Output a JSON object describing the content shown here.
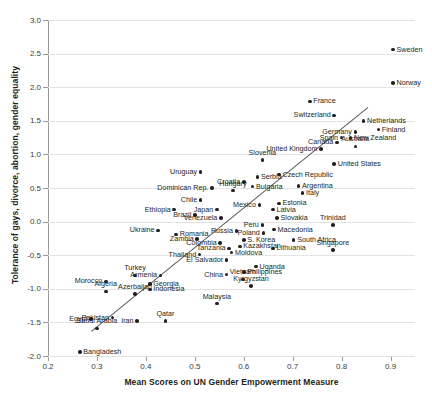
{
  "chart_data": {
    "type": "scatter",
    "title": "",
    "xlabel": "Mean Scores on UN Gender Empowerment Measure",
    "ylabel": "Tolerance of gays, divorce, abortion, gender equality",
    "xlim": [
      0.2,
      0.95
    ],
    "ylim": [
      -2.0,
      3.0
    ],
    "xticks": [
      "0.2",
      "0.3",
      "0.4",
      "0.5",
      "0.6",
      "0.7",
      "0.8",
      "0.9"
    ],
    "xtick_values": [
      0.2,
      0.3,
      0.4,
      0.5,
      0.6,
      0.7,
      0.8,
      0.9
    ],
    "yticks": [
      "3.0",
      "2.5",
      "2.0",
      "1.5",
      "1.0",
      "0.5",
      "0.0",
      "-0.5",
      "-1.0",
      "-1.5",
      "-2.0"
    ],
    "ytick_values": [
      3.0,
      2.5,
      2.0,
      1.5,
      1.0,
      0.5,
      0.0,
      -0.5,
      -1.0,
      -1.5,
      -2.0
    ],
    "grid": true,
    "legend": "none",
    "marker_color": "#231f20",
    "gridline_color": "#e3e3e3",
    "trendline": {
      "x0": 0.287,
      "y0": -1.63,
      "x1": 0.852,
      "y1": 1.7,
      "color": "#5a5a5a"
    },
    "points": [
      {
        "label": "Sweden",
        "x": 0.905,
        "y": 2.56,
        "pos": "l"
      },
      {
        "label": "Norway",
        "x": 0.905,
        "y": 2.06,
        "pos": "l"
      },
      {
        "label": "France",
        "x": 0.735,
        "y": 1.79,
        "pos": "l"
      },
      {
        "label": "Switzerland",
        "x": 0.785,
        "y": 1.58,
        "pos": "r"
      },
      {
        "label": "Netherlands",
        "x": 0.845,
        "y": 1.5,
        "pos": "l"
      },
      {
        "label": "Finland",
        "x": 0.875,
        "y": 1.37,
        "pos": "l"
      },
      {
        "label": "Germany",
        "x": 0.828,
        "y": 1.33,
        "pos": "r"
      },
      {
        "label": "Spain",
        "x": 0.8,
        "y": 1.25,
        "pos": "r"
      },
      {
        "label": "New Zealand",
        "x": 0.818,
        "y": 1.24,
        "pos": "l"
      },
      {
        "label": "Canada",
        "x": 0.79,
        "y": 1.18,
        "pos": "r"
      },
      {
        "label": "Australia",
        "x": 0.828,
        "y": 1.12,
        "pos": "c"
      },
      {
        "label": "United Kingdom",
        "x": 0.758,
        "y": 1.08,
        "pos": "r"
      },
      {
        "label": "United States",
        "x": 0.785,
        "y": 0.86,
        "pos": "l"
      },
      {
        "label": "Slovenia",
        "x": 0.638,
        "y": 0.92,
        "pos": "c"
      },
      {
        "label": "Czech Republic",
        "x": 0.672,
        "y": 0.7,
        "pos": "l"
      },
      {
        "label": "Uruguay",
        "x": 0.512,
        "y": 0.74,
        "pos": "r"
      },
      {
        "label": "Serbia",
        "x": 0.628,
        "y": 0.66,
        "pos": "l"
      },
      {
        "label": "Croatia",
        "x": 0.6,
        "y": 0.59,
        "pos": "r"
      },
      {
        "label": "Bulgaria",
        "x": 0.618,
        "y": 0.52,
        "pos": "l"
      },
      {
        "label": "Dominican Rep.",
        "x": 0.535,
        "y": 0.5,
        "pos": "r"
      },
      {
        "label": "Argentina",
        "x": 0.712,
        "y": 0.53,
        "pos": "l"
      },
      {
        "label": "Italy",
        "x": 0.72,
        "y": 0.43,
        "pos": "l"
      },
      {
        "label": "Hungary",
        "x": 0.578,
        "y": 0.46,
        "pos": "c"
      },
      {
        "label": "Chile",
        "x": 0.512,
        "y": 0.32,
        "pos": "r"
      },
      {
        "label": "Estonia",
        "x": 0.672,
        "y": 0.27,
        "pos": "l"
      },
      {
        "label": "Mexico",
        "x": 0.632,
        "y": 0.25,
        "pos": "r"
      },
      {
        "label": "Japan",
        "x": 0.545,
        "y": 0.18,
        "pos": "r"
      },
      {
        "label": "Ethiopia",
        "x": 0.458,
        "y": 0.18,
        "pos": "r"
      },
      {
        "label": "Latvia",
        "x": 0.66,
        "y": 0.18,
        "pos": "l"
      },
      {
        "label": "Brazil",
        "x": 0.5,
        "y": 0.1,
        "pos": "r"
      },
      {
        "label": "Venezuela",
        "x": 0.553,
        "y": 0.05,
        "pos": "r"
      },
      {
        "label": "Slovakia",
        "x": 0.668,
        "y": 0.05,
        "pos": "l"
      },
      {
        "label": "Peru",
        "x": 0.638,
        "y": -0.05,
        "pos": "r"
      },
      {
        "label": "Trinidad",
        "x": 0.782,
        "y": -0.05,
        "pos": "c"
      },
      {
        "label": "Ukraine",
        "x": 0.425,
        "y": -0.13,
        "pos": "r"
      },
      {
        "label": "Macedonia",
        "x": 0.662,
        "y": -0.12,
        "pos": "l"
      },
      {
        "label": "Russia",
        "x": 0.585,
        "y": -0.14,
        "pos": "r"
      },
      {
        "label": "Poland",
        "x": 0.64,
        "y": -0.17,
        "pos": "r"
      },
      {
        "label": "Romania",
        "x": 0.462,
        "y": -0.19,
        "pos": "l"
      },
      {
        "label": "Zambia",
        "x": 0.505,
        "y": -0.26,
        "pos": "r"
      },
      {
        "label": "S. Korea",
        "x": 0.6,
        "y": -0.27,
        "pos": "l"
      },
      {
        "label": "South Africa",
        "x": 0.702,
        "y": -0.27,
        "pos": "l"
      },
      {
        "label": "Colombia",
        "x": 0.552,
        "y": -0.32,
        "pos": "r"
      },
      {
        "label": "Kazakhstan",
        "x": 0.592,
        "y": -0.37,
        "pos": "l"
      },
      {
        "label": "Tanzania",
        "x": 0.57,
        "y": -0.4,
        "pos": "r"
      },
      {
        "label": "Lithuania",
        "x": 0.66,
        "y": -0.4,
        "pos": "l"
      },
      {
        "label": "Singapore",
        "x": 0.782,
        "y": -0.42,
        "pos": "c"
      },
      {
        "label": "Moldova",
        "x": 0.575,
        "y": -0.46,
        "pos": "l"
      },
      {
        "label": "Thailand",
        "x": 0.51,
        "y": -0.49,
        "pos": "r"
      },
      {
        "label": "El Salvador",
        "x": 0.565,
        "y": -0.57,
        "pos": "r"
      },
      {
        "label": "Uganda",
        "x": 0.625,
        "y": -0.67,
        "pos": "l"
      },
      {
        "label": "China",
        "x": 0.565,
        "y": -0.79,
        "pos": "r"
      },
      {
        "label": "Philippines",
        "x": 0.6,
        "y": -0.75,
        "pos": "l"
      },
      {
        "label": "Turkey",
        "x": 0.378,
        "y": -0.8,
        "pos": "c"
      },
      {
        "label": "Armenia",
        "x": 0.43,
        "y": -0.8,
        "pos": "r"
      },
      {
        "label": "Vietnam",
        "x": 0.598,
        "y": -0.86,
        "pos": "c"
      },
      {
        "label": "Morocco",
        "x": 0.318,
        "y": -0.89,
        "pos": "r"
      },
      {
        "label": "Georgia",
        "x": 0.408,
        "y": -0.93,
        "pos": "l"
      },
      {
        "label": "Kyrgyzstan",
        "x": 0.615,
        "y": -0.96,
        "pos": "c"
      },
      {
        "label": "Indonesia",
        "x": 0.408,
        "y": -1.01,
        "pos": "l"
      },
      {
        "label": "Algeria",
        "x": 0.318,
        "y": -1.04,
        "pos": "c"
      },
      {
        "label": "Azerbaijan",
        "x": 0.378,
        "y": -1.08,
        "pos": "c"
      },
      {
        "label": "Malaysia",
        "x": 0.545,
        "y": -1.22,
        "pos": "c"
      },
      {
        "label": "Egypt",
        "x": 0.288,
        "y": -1.45,
        "pos": "r"
      },
      {
        "label": "Pakistan",
        "x": 0.332,
        "y": -1.43,
        "pos": "r"
      },
      {
        "label": "Qatar",
        "x": 0.44,
        "y": -1.48,
        "pos": "c"
      },
      {
        "label": "Iran",
        "x": 0.382,
        "y": -1.48,
        "pos": "r"
      },
      {
        "label": "Saudi Arabia",
        "x": 0.3,
        "y": -1.59,
        "pos": "c"
      },
      {
        "label": "Bangladesh",
        "x": 0.265,
        "y": -1.94,
        "pos": "l"
      }
    ]
  }
}
